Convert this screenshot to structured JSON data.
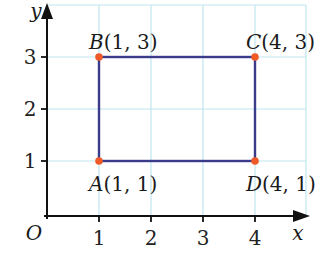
{
  "diagram": {
    "type": "coordinate-plane-rectangle",
    "axes": {
      "x_label": "x",
      "y_label": "y",
      "origin_label": "O",
      "x_ticks": [
        "1",
        "2",
        "3",
        "4"
      ],
      "y_ticks": [
        "1",
        "2",
        "3"
      ]
    },
    "points": [
      {
        "name": "A",
        "coords": "(1, 1)",
        "x": 1,
        "y": 1
      },
      {
        "name": "B",
        "coords": "(1, 3)",
        "x": 1,
        "y": 3
      },
      {
        "name": "C",
        "coords": "(4, 3)",
        "x": 4,
        "y": 3
      },
      {
        "name": "D",
        "coords": "(4, 1)",
        "x": 4,
        "y": 1
      }
    ],
    "colors": {
      "grid": "#bfe6ee",
      "axis": "#111111",
      "rectangle": "#3b3b8c",
      "point": "#f05a28"
    }
  }
}
